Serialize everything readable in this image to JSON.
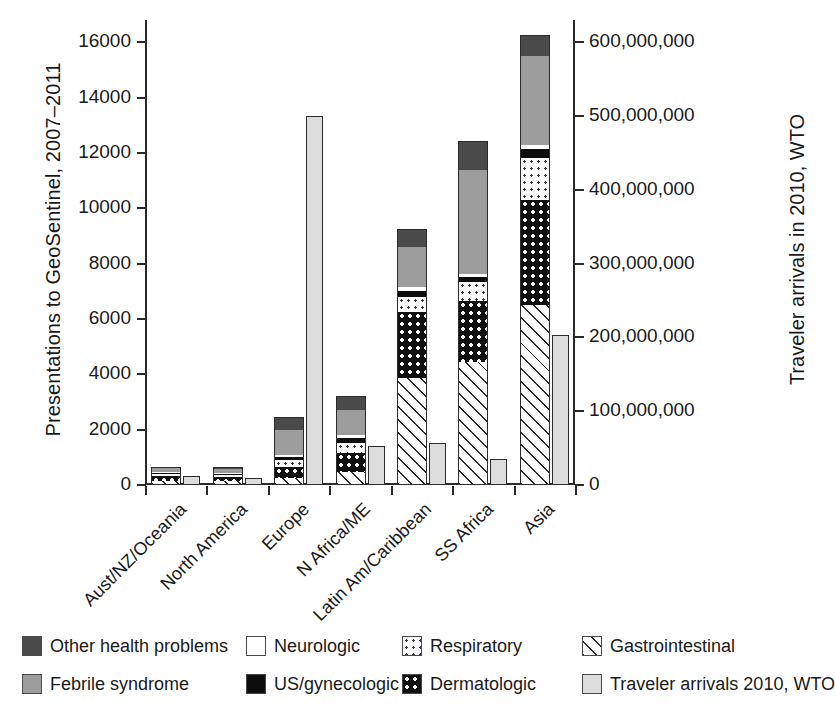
{
  "chart_data": {
    "type": "bar",
    "subtype": "stacked-bar-with-overlay",
    "title": "",
    "categories": [
      "Aust/NZ/Oceania",
      "North America",
      "Europe",
      "N Africa/ME",
      "Latin Am/Caribbean",
      "SS Africa",
      "Asia"
    ],
    "ylabel": "Presentations to GeoSentinel, 2007–2011",
    "ylabel_right": "Traveler arrivals in 2010, WTO",
    "xlabel": "",
    "ylim": [
      0,
      16800
    ],
    "yticks": [
      0,
      2000,
      4000,
      6000,
      8000,
      10000,
      12000,
      14000,
      16000
    ],
    "ytick_labels": [
      "0",
      "2000",
      "4000",
      "6000",
      "8000",
      "10000",
      "12000",
      "14000",
      "16000"
    ],
    "ylim_right": [
      0,
      630000000
    ],
    "yticks_right": [
      0,
      100000000,
      200000000,
      300000000,
      400000000,
      500000000,
      600000000
    ],
    "ytick_labels_right": [
      "0",
      "100,000,000",
      "200,000,000",
      "300,000,000",
      "400,000,000",
      "500,000,000",
      "600,000,000"
    ],
    "grid": false,
    "legend_position": "bottom",
    "stack_order_bottom_to_top": [
      "Gastrointestinal",
      "Dermatologic",
      "Respiratory",
      "US/gynecologic",
      "Neurologic",
      "Febrile syndrome",
      "Other health problems"
    ],
    "series": [
      {
        "name": "Gastrointestinal",
        "key": "gi",
        "values": [
          120,
          110,
          230,
          430,
          3830,
          4420,
          6480
        ]
      },
      {
        "name": "Dermatologic",
        "key": "derm",
        "values": [
          170,
          130,
          390,
          700,
          2370,
          2190,
          3770
        ]
      },
      {
        "name": "Respiratory",
        "key": "resp",
        "values": [
          80,
          80,
          250,
          340,
          570,
          700,
          1520
        ]
      },
      {
        "name": "US/gynecologic",
        "key": "usgyn",
        "values": [
          45,
          40,
          120,
          210,
          220,
          170,
          340
        ]
      },
      {
        "name": "Neurologic",
        "key": "neuro",
        "values": [
          30,
          25,
          70,
          100,
          130,
          110,
          140
        ]
      },
      {
        "name": "Febrile syndrome",
        "key": "febrile",
        "values": [
          130,
          150,
          880,
          910,
          1440,
          3750,
          3210
        ]
      },
      {
        "name": "Other health problems",
        "key": "other",
        "values": [
          90,
          110,
          510,
          530,
          690,
          1090,
          790
        ]
      }
    ],
    "totals": [
      665,
      645,
      2450,
      3220,
      9250,
      12430,
      16250
    ],
    "overlay_series": {
      "name": "Traveler arrivals 2010, WTO",
      "key": "travel",
      "unit": "arrivals",
      "values": [
        11600000,
        9900000,
        500000000,
        53000000,
        57000000,
        35000000,
        203000000
      ]
    }
  },
  "legend": {
    "row1": [
      {
        "label": "Other health problems",
        "swatch": "f-other",
        "icon": "swatch-other-health-problems"
      },
      {
        "label": "Neurologic",
        "swatch": "f-neuro",
        "icon": "swatch-neurologic"
      },
      {
        "label": "Respiratory",
        "swatch": "f-resp",
        "icon": "swatch-respiratory"
      },
      {
        "label": "Gastrointestinal",
        "swatch": "f-gi",
        "icon": "swatch-gastrointestinal"
      }
    ],
    "row2": [
      {
        "label": "Febrile syndrome",
        "swatch": "f-febrile",
        "icon": "swatch-febrile-syndrome"
      },
      {
        "label": "US/gynecologic",
        "swatch": "f-usgyn",
        "icon": "swatch-us-gynecologic"
      },
      {
        "label": "Dermatologic",
        "swatch": "f-derm",
        "icon": "swatch-dermatologic"
      },
      {
        "label": "Traveler arrivals 2010, WTO",
        "swatch": "f-travel",
        "icon": "swatch-traveler-arrivals"
      }
    ]
  },
  "colors": {
    "other_health_problems": "#4a4a4a",
    "febrile_syndrome": "#9d9d9d",
    "neurologic": "#ffffff",
    "us_gynecologic": "#0d0d0d",
    "respiratory": "#fbfbfb",
    "dermatologic": "#101010",
    "gastrointestinal": "#ffffff",
    "traveler_arrivals": "#dcdcdc",
    "axis": "#2a2a2a"
  }
}
